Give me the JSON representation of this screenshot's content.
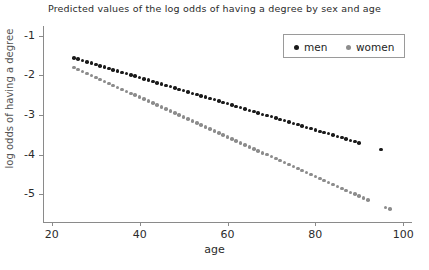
{
  "chart_data": {
    "type": "scatter",
    "title": "Predicted values of the log odds of having a degree by sex and age",
    "xlabel": "age",
    "ylabel": "log odds of having a degree",
    "xlim": [
      18,
      102
    ],
    "ylim": [
      -5.7,
      -0.75
    ],
    "xticks": [
      20,
      40,
      60,
      80,
      100
    ],
    "xticklabels": [
      "20",
      "40",
      "60",
      "80",
      "100"
    ],
    "yticks": [
      -1,
      -2,
      -3,
      -4,
      -5
    ],
    "yticklabels": [
      "-1",
      "-2",
      "-3",
      "-4",
      "-5"
    ],
    "grid": false,
    "legend_position": "top-right",
    "series": [
      {
        "name": "men",
        "color": "#1a1a1a",
        "x": [
          25,
          26,
          27,
          28,
          29,
          30,
          31,
          32,
          33,
          34,
          35,
          36,
          37,
          38,
          39,
          40,
          41,
          42,
          43,
          44,
          45,
          46,
          47,
          48,
          49,
          50,
          51,
          52,
          53,
          54,
          55,
          56,
          57,
          58,
          59,
          60,
          61,
          62,
          63,
          64,
          65,
          66,
          67,
          68,
          69,
          70,
          71,
          72,
          73,
          74,
          75,
          76,
          77,
          78,
          79,
          80,
          81,
          82,
          83,
          84,
          85,
          86,
          87,
          88,
          89,
          90,
          95
        ],
        "y": [
          -1.56,
          -1.59,
          -1.62,
          -1.66,
          -1.69,
          -1.72,
          -1.76,
          -1.79,
          -1.82,
          -1.86,
          -1.89,
          -1.92,
          -1.95,
          -1.99,
          -2.02,
          -2.05,
          -2.09,
          -2.12,
          -2.15,
          -2.19,
          -2.22,
          -2.25,
          -2.28,
          -2.32,
          -2.35,
          -2.38,
          -2.42,
          -2.45,
          -2.48,
          -2.52,
          -2.55,
          -2.58,
          -2.61,
          -2.65,
          -2.68,
          -2.71,
          -2.75,
          -2.78,
          -2.81,
          -2.85,
          -2.88,
          -2.91,
          -2.94,
          -2.98,
          -3.01,
          -3.04,
          -3.08,
          -3.11,
          -3.14,
          -3.18,
          -3.21,
          -3.24,
          -3.27,
          -3.31,
          -3.34,
          -3.37,
          -3.41,
          -3.44,
          -3.47,
          -3.51,
          -3.54,
          -3.57,
          -3.6,
          -3.64,
          -3.67,
          -3.7,
          -3.87
        ]
      },
      {
        "name": "women",
        "color": "#8c8c8c",
        "x": [
          25,
          26,
          27,
          28,
          29,
          30,
          31,
          32,
          33,
          34,
          35,
          36,
          37,
          38,
          39,
          40,
          41,
          42,
          43,
          44,
          45,
          46,
          47,
          48,
          49,
          50,
          51,
          52,
          53,
          54,
          55,
          56,
          57,
          58,
          59,
          60,
          61,
          62,
          63,
          64,
          65,
          66,
          67,
          68,
          69,
          70,
          71,
          72,
          73,
          74,
          75,
          76,
          77,
          78,
          79,
          80,
          81,
          82,
          83,
          84,
          85,
          86,
          87,
          88,
          89,
          90,
          91,
          92,
          96,
          97
        ],
        "y": [
          -1.8,
          -1.85,
          -1.9,
          -1.95,
          -2.0,
          -2.05,
          -2.1,
          -2.15,
          -2.2,
          -2.25,
          -2.3,
          -2.35,
          -2.4,
          -2.45,
          -2.5,
          -2.55,
          -2.6,
          -2.65,
          -2.7,
          -2.75,
          -2.8,
          -2.85,
          -2.9,
          -2.95,
          -3.0,
          -3.05,
          -3.1,
          -3.15,
          -3.2,
          -3.25,
          -3.3,
          -3.35,
          -3.4,
          -3.45,
          -3.5,
          -3.55,
          -3.6,
          -3.65,
          -3.7,
          -3.75,
          -3.8,
          -3.85,
          -3.9,
          -3.95,
          -4.0,
          -4.05,
          -4.1,
          -4.15,
          -4.2,
          -4.25,
          -4.3,
          -4.35,
          -4.4,
          -4.45,
          -4.5,
          -4.55,
          -4.6,
          -4.65,
          -4.7,
          -4.75,
          -4.8,
          -4.85,
          -4.9,
          -4.95,
          -5.0,
          -5.05,
          -5.1,
          -5.15,
          -5.33,
          -5.37
        ]
      }
    ]
  },
  "legend": {
    "entries": [
      {
        "label": "men",
        "color": "#1a1a1a"
      },
      {
        "label": "women",
        "color": "#8c8c8c"
      }
    ]
  }
}
